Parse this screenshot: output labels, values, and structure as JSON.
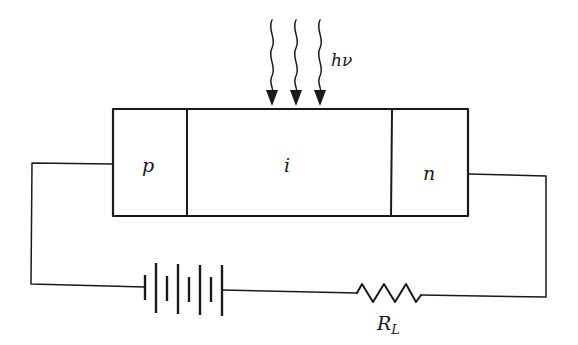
{
  "diagram": {
    "regions": [
      {
        "id": "p",
        "label": "p"
      },
      {
        "id": "i",
        "label": "i"
      },
      {
        "id": "n",
        "label": "n"
      }
    ],
    "light": {
      "label": "hν",
      "label_main": "h",
      "label_nu": "ν",
      "arrow_count": 3
    },
    "battery": {
      "cells": 4
    },
    "resistor": {
      "label_main": "R",
      "label_sub": "L"
    },
    "stroke_color": "#1a1a1a"
  }
}
